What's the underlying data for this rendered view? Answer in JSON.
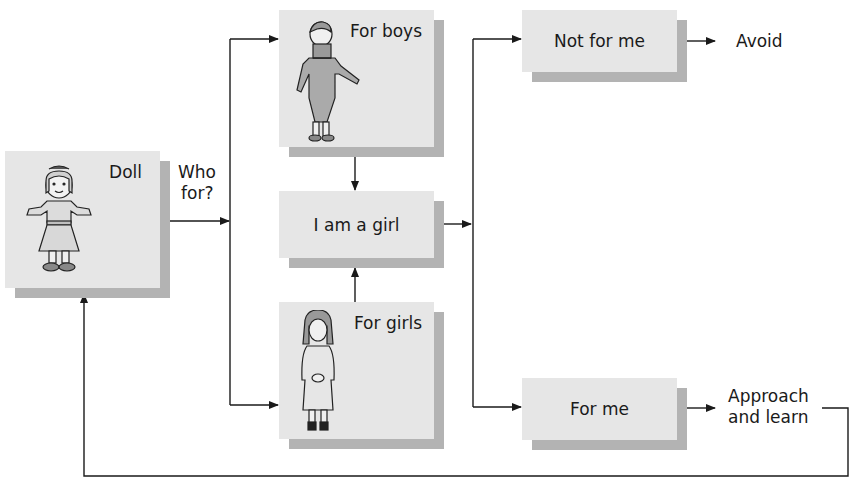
{
  "diagram": {
    "nodes": {
      "doll": {
        "label": "Doll",
        "illustration": "doll-figure"
      },
      "for_boys": {
        "label": "For boys",
        "illustration": "boy-figure"
      },
      "i_am_a_girl": {
        "label": "I am a girl"
      },
      "for_girls": {
        "label": "For girls",
        "illustration": "girl-figure"
      },
      "not_for_me": {
        "label": "Not for me"
      },
      "for_me": {
        "label": "For me"
      }
    },
    "edge_labels": {
      "who_for_line1": "Who",
      "who_for_line2": "for?",
      "avoid": "Avoid",
      "approach_line1": "Approach",
      "approach_line2": "and learn"
    },
    "colors": {
      "box_fill": "#e6e6e6",
      "box_shadow": "#b3b3b3",
      "line": "#1a1a1a"
    }
  }
}
